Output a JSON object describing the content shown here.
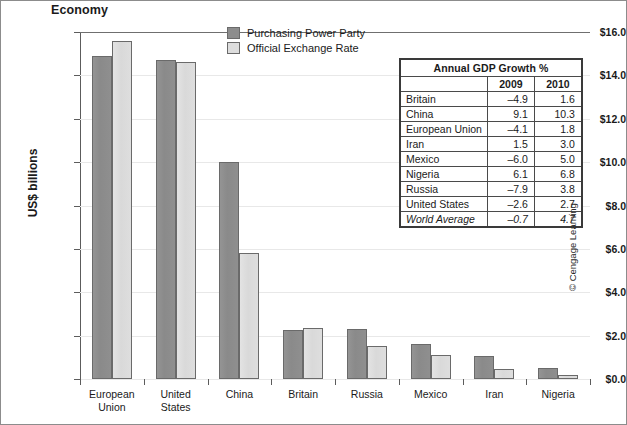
{
  "chart_title": "Economy",
  "credit": "© Cengage Learning",
  "legend": {
    "items": [
      {
        "label": "Purchasing Power Party",
        "key": "ppp",
        "color": "#8d8d8d"
      },
      {
        "label": "Official Exchange Rate",
        "key": "oer",
        "color": "#dddddd"
      }
    ]
  },
  "table": {
    "title": "Annual GDP Growth %",
    "columns": [
      "",
      "2009",
      "2010"
    ],
    "rows": [
      {
        "name": "Britain",
        "y2009": "–4.9",
        "y2010": "1.6",
        "italic": false
      },
      {
        "name": "China",
        "y2009": "9.1",
        "y2010": "10.3",
        "italic": false
      },
      {
        "name": "European Union",
        "y2009": "–4.1",
        "y2010": "1.8",
        "italic": false
      },
      {
        "name": "Iran",
        "y2009": "1.5",
        "y2010": "3.0",
        "italic": false
      },
      {
        "name": "Mexico",
        "y2009": "–6.0",
        "y2010": "5.0",
        "italic": false
      },
      {
        "name": "Nigeria",
        "y2009": "6.1",
        "y2010": "6.8",
        "italic": false
      },
      {
        "name": "Russia",
        "y2009": "–7.9",
        "y2010": "3.8",
        "italic": false
      },
      {
        "name": "United States",
        "y2009": "–2.6",
        "y2010": "2.7",
        "italic": false
      },
      {
        "name": "World Average",
        "y2009": "–0.7",
        "y2010": "4.7",
        "italic": true
      }
    ]
  },
  "chart_data": {
    "type": "bar",
    "title": "Economy",
    "xlabel": "",
    "ylabel": "US$ billions",
    "ylim": [
      0.0,
      16.0
    ],
    "ytick_step": 2.0,
    "ytick_labels": [
      "$16.0",
      "$14.0",
      "$12.0",
      "$10.0",
      "$8.0",
      "$6.0",
      "$4.0",
      "$2.0",
      "$0.0"
    ],
    "ytick_values": [
      16.0,
      14.0,
      12.0,
      10.0,
      8.0,
      6.0,
      4.0,
      2.0,
      0.0
    ],
    "grid": true,
    "legend_position": "top-center",
    "categories": [
      "European Union",
      "United States",
      "China",
      "Britain",
      "Russia",
      "Mexico",
      "Iran",
      "Nigeria"
    ],
    "category_lines": [
      [
        "European",
        "Union"
      ],
      [
        "United",
        "States"
      ],
      [
        "China"
      ],
      [
        "Britain"
      ],
      [
        "Russia"
      ],
      [
        "Mexico"
      ],
      [
        "Iran"
      ],
      [
        "Nigeria"
      ]
    ],
    "series": [
      {
        "name": "Purchasing Power Party",
        "color": "#8d8d8d",
        "values": [
          14.9,
          14.7,
          10.0,
          2.25,
          2.3,
          1.6,
          1.05,
          0.5
        ]
      },
      {
        "name": "Official Exchange Rate",
        "color": "#dddddd",
        "values": [
          15.6,
          14.6,
          5.8,
          2.35,
          1.5,
          1.1,
          0.45,
          0.2
        ]
      }
    ]
  }
}
